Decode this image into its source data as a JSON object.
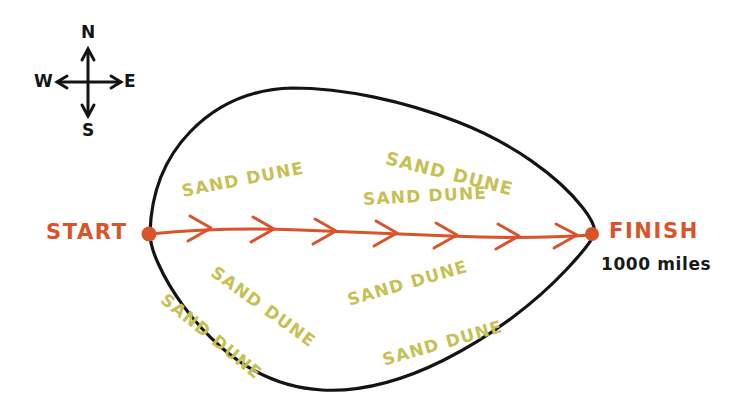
{
  "figure": {
    "kind": "hand-drawn-map-sketch",
    "background_color": "#ffffff",
    "ink_color": "#141414",
    "route_color": "#d9532b",
    "dune_color": "#c6c055"
  },
  "compass": {
    "north_label": "N",
    "east_label": "E",
    "south_label": "S",
    "west_label": "W"
  },
  "route": {
    "start_label": "START",
    "finish_label": "FINISH",
    "distance_label": "1000 miles",
    "arrowhead_count": 7
  },
  "terrain": {
    "dune_label": "SAND DUNE",
    "dunes": [
      {
        "text": "SAND DUNE",
        "x": 182,
        "y": 183,
        "rotation": -11,
        "size": 17
      },
      {
        "text": "SAND DUNE",
        "x": 386,
        "y": 149,
        "rotation": 14,
        "size": 18
      },
      {
        "text": "SAND DUNE",
        "x": 363,
        "y": 191,
        "rotation": -3,
        "size": 17
      },
      {
        "text": "SAND DUNE",
        "x": 213,
        "y": 262,
        "rotation": 36,
        "size": 17
      },
      {
        "text": "SAND DUNE",
        "x": 163,
        "y": 289,
        "rotation": 39,
        "size": 17
      },
      {
        "text": "SAND DUNE",
        "x": 348,
        "y": 292,
        "rotation": -16,
        "size": 17
      },
      {
        "text": "SAND DUNE",
        "x": 383,
        "y": 352,
        "rotation": -16,
        "size": 17
      }
    ]
  }
}
